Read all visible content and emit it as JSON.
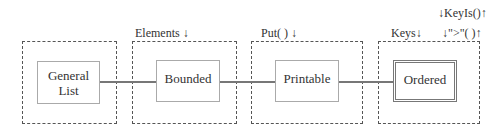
{
  "diagram": {
    "nodes": [
      {
        "id": "general-list",
        "label_line1": "General",
        "label_line2": "List"
      },
      {
        "id": "bounded",
        "label": "Bounded"
      },
      {
        "id": "printable",
        "label": "Printable"
      },
      {
        "id": "ordered",
        "label": "Ordered"
      }
    ],
    "container_labels": {
      "bounded": "Elements ↓",
      "printable": "Put( ) ↓",
      "ordered_left": "Keys↓",
      "ordered_right": "↓\">\"( )↑",
      "ordered_top": "↓KeyIs()↑"
    },
    "edges": [
      {
        "from": "general-list",
        "to": "bounded"
      },
      {
        "from": "bounded",
        "to": "printable"
      },
      {
        "from": "printable",
        "to": "ordered"
      }
    ]
  }
}
